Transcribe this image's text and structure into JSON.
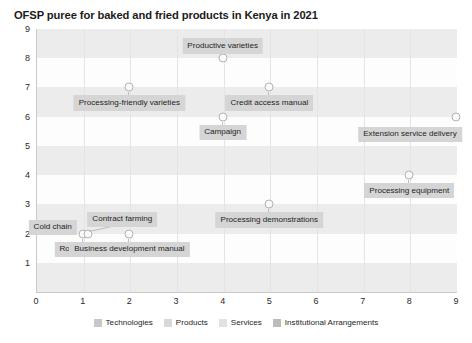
{
  "chart_data": {
    "type": "scatter",
    "title": "OFSP puree for baked and fried products in Kenya in 2021",
    "xlabel": "",
    "ylabel": "",
    "xlim": [
      0,
      9
    ],
    "ylim": [
      0,
      9
    ],
    "xticks": [
      "0",
      "1",
      "2",
      "3",
      "4",
      "5",
      "6",
      "7",
      "8",
      "9"
    ],
    "yticks": [
      "1",
      "2",
      "3",
      "4",
      "5",
      "6",
      "7",
      "8",
      "9"
    ],
    "grid": "horizontal-bands",
    "legend_position": "bottom",
    "points": [
      {
        "label": "Productive varieties",
        "x": 4,
        "y": 8,
        "label_pos": "above"
      },
      {
        "label": "Processing-friendly varieties",
        "x": 2,
        "y": 7,
        "label_pos": "below"
      },
      {
        "label": "Credit access manual",
        "x": 5,
        "y": 7,
        "label_pos": "below"
      },
      {
        "label": "Campaign",
        "x": 4,
        "y": 6,
        "label_pos": "below"
      },
      {
        "label": "Extension service delivery",
        "x": 9,
        "y": 6,
        "label_pos": "below-left"
      },
      {
        "label": "Processing equipment",
        "x": 8,
        "y": 4,
        "label_pos": "below"
      },
      {
        "label": "Processing demonstrations",
        "x": 5,
        "y": 3,
        "label_pos": "below"
      },
      {
        "label": "Cold chain",
        "x": 1,
        "y": 2,
        "label_pos": "left"
      },
      {
        "label": "Contract farming",
        "x": 1.12,
        "y": 2,
        "label_pos": "above-right"
      },
      {
        "label": "Root storage",
        "x": 1,
        "y": 2,
        "label_pos": "below"
      },
      {
        "label": "Business development manual",
        "x": 2,
        "y": 2,
        "label_pos": "below"
      }
    ],
    "legend": [
      {
        "name": "Technologies",
        "color": "#c8c8c8"
      },
      {
        "name": "Products",
        "color": "#d8d8d8"
      },
      {
        "name": "Services",
        "color": "#e2e2e2"
      },
      {
        "name": "Institutional Arrangements",
        "color": "#bcbcbc"
      }
    ]
  }
}
